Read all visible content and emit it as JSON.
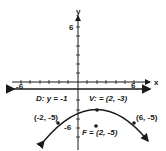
{
  "diagram": {
    "type": "parabola-graph",
    "axes": {
      "x_label": "x",
      "y_label": "y",
      "x_tick_left_label": "-6",
      "x_tick_right_label": "6",
      "y_tick_top_label": "6",
      "y_tick_bottom_label": "-6"
    },
    "directrix_label": "D: y = -1",
    "vertex_label": "V: = (2, -3)",
    "focus_label": "F = (2, -5)",
    "point_left_label": "(-2, -5)",
    "point_right_label": "(6, -5)",
    "colors": {
      "ink": "#1a1a1a",
      "background": "#ffffff"
    }
  }
}
